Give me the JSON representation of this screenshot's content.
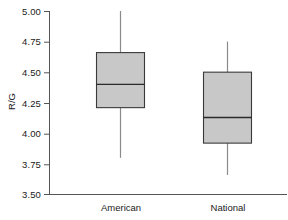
{
  "chart_data": {
    "type": "box",
    "title": "",
    "xlabel": "",
    "ylabel": "R/G",
    "ylim": [
      3.5,
      5.0
    ],
    "yticks": [
      3.5,
      3.75,
      4.0,
      4.25,
      4.5,
      4.75,
      5.0
    ],
    "ytick_labels": [
      "3.50",
      "3.75",
      "4.00",
      "4.25",
      "4.50",
      "4.75",
      "5.00"
    ],
    "grid": false,
    "legend": "none",
    "categories": [
      "American",
      "National"
    ],
    "box_fill_color": "#c8c8c8",
    "box_edge_color": "#333333",
    "whisker_color": "#777777",
    "axis_color": "#555555",
    "boxes": [
      {
        "label": "American",
        "whisker_low": 3.8,
        "q1": 4.21,
        "median": 4.4,
        "q3": 4.66,
        "whisker_high": 5.0
      },
      {
        "label": "National",
        "whisker_low": 3.66,
        "q1": 3.92,
        "median": 4.13,
        "q3": 4.5,
        "whisker_high": 4.75
      }
    ]
  },
  "axis": {
    "y_title": "R/G",
    "tick_0": "3.50",
    "tick_1": "3.75",
    "tick_2": "4.00",
    "tick_3": "4.25",
    "tick_4": "4.50",
    "tick_5": "4.75",
    "tick_6": "5.00",
    "cat_0": "American",
    "cat_1": "National"
  }
}
